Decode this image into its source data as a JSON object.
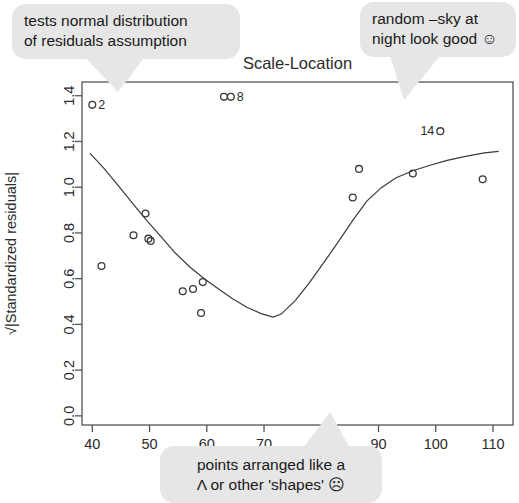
{
  "chart_data": {
    "type": "scatter",
    "title": "Scale-Location",
    "xlabel": "",
    "ylabel": "√|Standardized residuals|",
    "xlim": [
      38.2,
      113.5
    ],
    "ylim": [
      -0.04,
      1.46
    ],
    "xticks": [
      40,
      50,
      60,
      70,
      80,
      90,
      100,
      110
    ],
    "xticklabels": [
      "40",
      "50",
      "60",
      "70",
      "80",
      "90",
      "100",
      "110"
    ],
    "yticks": [
      0.0,
      0.2,
      0.4,
      0.6,
      0.8,
      1.0,
      1.2,
      1.4
    ],
    "yticklabels": [
      "0.0",
      "0.2",
      "0.4",
      "0.6",
      "0.8",
      "1.0",
      "1.2",
      "1.4"
    ],
    "grid": false,
    "legend": null,
    "points": [
      {
        "x": 40.0,
        "y": 1.36,
        "label": "2"
      },
      {
        "x": 41.6,
        "y": 0.655,
        "label": ""
      },
      {
        "x": 47.2,
        "y": 0.79,
        "label": ""
      },
      {
        "x": 49.3,
        "y": 0.885,
        "label": ""
      },
      {
        "x": 49.8,
        "y": 0.775,
        "label": ""
      },
      {
        "x": 50.2,
        "y": 0.765,
        "label": ""
      },
      {
        "x": 55.8,
        "y": 0.545,
        "label": ""
      },
      {
        "x": 57.6,
        "y": 0.555,
        "label": ""
      },
      {
        "x": 59.0,
        "y": 0.45,
        "label": ""
      },
      {
        "x": 59.3,
        "y": 0.585,
        "label": ""
      },
      {
        "x": 63.0,
        "y": 1.395,
        "label": ""
      },
      {
        "x": 64.2,
        "y": 1.395,
        "label": "8"
      },
      {
        "x": 85.5,
        "y": 0.955,
        "label": ""
      },
      {
        "x": 86.6,
        "y": 1.08,
        "label": ""
      },
      {
        "x": 96.0,
        "y": 1.06,
        "label": ""
      },
      {
        "x": 100.8,
        "y": 1.245,
        "label": "14"
      },
      {
        "x": 108.2,
        "y": 1.035,
        "label": ""
      }
    ],
    "loess": [
      [
        39.6,
        1.148
      ],
      [
        42.0,
        1.083
      ],
      [
        44.5,
        1.008
      ],
      [
        47.0,
        0.93
      ],
      [
        49.5,
        0.855
      ],
      [
        52.0,
        0.784
      ],
      [
        54.5,
        0.712
      ],
      [
        57.0,
        0.652
      ],
      [
        59.5,
        0.601
      ],
      [
        62.0,
        0.556
      ],
      [
        64.5,
        0.512
      ],
      [
        67.0,
        0.475
      ],
      [
        69.5,
        0.447
      ],
      [
        71.6,
        0.432
      ],
      [
        73.0,
        0.445
      ],
      [
        75.5,
        0.505
      ],
      [
        78.0,
        0.585
      ],
      [
        80.5,
        0.672
      ],
      [
        83.0,
        0.762
      ],
      [
        85.5,
        0.855
      ],
      [
        88.0,
        0.94
      ],
      [
        90.5,
        0.998
      ],
      [
        93.0,
        1.04
      ],
      [
        96.0,
        1.072
      ],
      [
        99.0,
        1.096
      ],
      [
        102.0,
        1.117
      ],
      [
        105.0,
        1.134
      ],
      [
        108.5,
        1.15
      ],
      [
        111.0,
        1.157
      ]
    ]
  },
  "annotations": {
    "normality": "tests normal distribution\nof residuals assumption",
    "random": "random –sky at\nnight look good ☺",
    "shapes": "points arranged like a\nΛ or other 'shapes' ☹"
  }
}
